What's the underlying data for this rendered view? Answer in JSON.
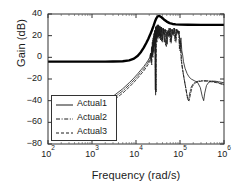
{
  "chart_data": {
    "type": "line",
    "title": "",
    "xlabel": "Frequency (rad/s)",
    "ylabel": "Gain (dB)",
    "xscale": "log",
    "yscale": "linear",
    "xlim": [
      100,
      1000000
    ],
    "ylim": [
      -80,
      40
    ],
    "grid": false,
    "legend_position": "lower-left",
    "xticks": [
      {
        "value": 100,
        "label": "10",
        "exp": "2"
      },
      {
        "value": 1000,
        "label": "10",
        "exp": "3"
      },
      {
        "value": 10000,
        "label": "10",
        "exp": "4"
      },
      {
        "value": 100000,
        "label": "10",
        "exp": "5"
      },
      {
        "value": 1000000,
        "label": "10",
        "exp": "6"
      }
    ],
    "yticks": [
      40,
      20,
      0,
      -20,
      -40,
      -60,
      -80
    ],
    "series": [
      {
        "name": "Nominal",
        "style": "solid-thick",
        "color": "#000000",
        "width": 2.4,
        "in_legend": false,
        "points": [
          [
            100,
            -4
          ],
          [
            300,
            -4
          ],
          [
            1000,
            -4
          ],
          [
            2000,
            -4
          ],
          [
            3000,
            -3.9
          ],
          [
            5000,
            -3.6
          ],
          [
            7000,
            -2.8
          ],
          [
            9000,
            -1.2
          ],
          [
            11000,
            1.5
          ],
          [
            13000,
            5
          ],
          [
            15000,
            9
          ],
          [
            17000,
            13
          ],
          [
            19000,
            17
          ],
          [
            21000,
            21
          ],
          [
            23000,
            25
          ],
          [
            25000,
            29
          ],
          [
            27000,
            33
          ],
          [
            29000,
            36
          ],
          [
            31000,
            37.8
          ],
          [
            34000,
            38.2
          ],
          [
            38000,
            37
          ],
          [
            43000,
            35
          ],
          [
            50000,
            33
          ],
          [
            58000,
            31.6
          ],
          [
            68000,
            30.8
          ],
          [
            80000,
            30.4
          ],
          [
            100000,
            30.2
          ],
          [
            150000,
            30.1
          ],
          [
            300000,
            30
          ],
          [
            600000,
            30
          ],
          [
            1000000,
            30
          ]
        ]
      },
      {
        "name": "Actual1",
        "style": "solid",
        "color": "#1a1a1a",
        "width": 0.8,
        "in_legend": true,
        "points": [
          [
            2000,
            -40
          ],
          [
            3000,
            -36
          ],
          [
            5000,
            -29
          ],
          [
            7000,
            -23.5
          ],
          [
            9000,
            -19
          ],
          [
            11000,
            -15
          ],
          [
            13000,
            -11.5
          ],
          [
            15000,
            -8.5
          ],
          [
            17000,
            -5.5
          ],
          [
            19000,
            -2.5
          ],
          [
            20500,
            0
          ],
          [
            21500,
            4
          ],
          [
            22000,
            -2
          ],
          [
            22500,
            9
          ],
          [
            23000,
            2
          ],
          [
            23500,
            14
          ],
          [
            24000,
            6
          ],
          [
            24500,
            18
          ],
          [
            25000,
            9
          ],
          [
            25500,
            22
          ],
          [
            26000,
            12
          ],
          [
            26500,
            25
          ],
          [
            27000,
            14
          ],
          [
            27500,
            -30
          ],
          [
            27800,
            28
          ],
          [
            28200,
            17
          ],
          [
            28800,
            29
          ],
          [
            29500,
            19
          ],
          [
            30500,
            30
          ],
          [
            31500,
            21
          ],
          [
            32500,
            30
          ],
          [
            33500,
            20
          ],
          [
            35000,
            29
          ],
          [
            36500,
            18
          ],
          [
            38000,
            28
          ],
          [
            40000,
            16
          ],
          [
            42000,
            27
          ],
          [
            44000,
            14
          ],
          [
            46000,
            26
          ],
          [
            48000,
            24
          ],
          [
            51000,
            12
          ],
          [
            54000,
            25
          ],
          [
            57000,
            20
          ],
          [
            60000,
            27
          ],
          [
            63000,
            16
          ],
          [
            67000,
            26
          ],
          [
            71000,
            22
          ],
          [
            75000,
            27
          ],
          [
            80000,
            18
          ],
          [
            85000,
            26
          ],
          [
            90000,
            22
          ],
          [
            95000,
            24
          ],
          [
            100000,
            12
          ],
          [
            105000,
            18
          ],
          [
            110000,
            6
          ],
          [
            115000,
            2
          ],
          [
            120000,
            -4
          ],
          [
            130000,
            -10
          ],
          [
            145000,
            -15
          ],
          [
            160000,
            -18
          ],
          [
            180000,
            -20
          ],
          [
            210000,
            -21.5
          ],
          [
            250000,
            -23
          ],
          [
            290000,
            -28
          ],
          [
            320000,
            -36
          ],
          [
            345000,
            -40
          ],
          [
            365000,
            -33
          ],
          [
            400000,
            -26
          ],
          [
            450000,
            -23
          ],
          [
            520000,
            -22
          ],
          [
            620000,
            -22
          ],
          [
            750000,
            -22.5
          ],
          [
            1000000,
            -23.5
          ]
        ]
      },
      {
        "name": "Actual2",
        "style": "dashdot",
        "color": "#1a1a1a",
        "width": 0.8,
        "in_legend": true,
        "points": [
          [
            2200,
            -43
          ],
          [
            3000,
            -38
          ],
          [
            5000,
            -31
          ],
          [
            7000,
            -25.5
          ],
          [
            9000,
            -21
          ],
          [
            11000,
            -17
          ],
          [
            13000,
            -13.5
          ],
          [
            15000,
            -10.5
          ],
          [
            17000,
            -7.5
          ],
          [
            19000,
            -4.5
          ],
          [
            20500,
            -2
          ],
          [
            21500,
            3
          ],
          [
            22200,
            -5
          ],
          [
            23000,
            10
          ],
          [
            23600,
            1
          ],
          [
            24200,
            16
          ],
          [
            24800,
            5
          ],
          [
            25400,
            20
          ],
          [
            26000,
            10
          ],
          [
            26600,
            24
          ],
          [
            27200,
            13
          ],
          [
            27900,
            -35
          ],
          [
            28300,
            27
          ],
          [
            28900,
            15
          ],
          [
            29600,
            29
          ],
          [
            30400,
            18
          ],
          [
            31400,
            30
          ],
          [
            32400,
            19
          ],
          [
            33600,
            29
          ],
          [
            35000,
            17
          ],
          [
            36500,
            28
          ],
          [
            38200,
            15
          ],
          [
            40000,
            27
          ],
          [
            42000,
            22
          ],
          [
            44500,
            26
          ],
          [
            47000,
            11
          ],
          [
            50000,
            25
          ],
          [
            53000,
            20
          ],
          [
            56500,
            27
          ],
          [
            60000,
            14
          ],
          [
            64000,
            26
          ],
          [
            68000,
            21
          ],
          [
            72500,
            27
          ],
          [
            77000,
            15
          ],
          [
            82000,
            26
          ],
          [
            87000,
            23
          ],
          [
            92000,
            25
          ],
          [
            97000,
            8
          ],
          [
            101000,
            15
          ],
          [
            106000,
            -2
          ],
          [
            111000,
            -8
          ],
          [
            117000,
            -14
          ],
          [
            124000,
            -20
          ],
          [
            132000,
            -26
          ],
          [
            140000,
            -32
          ],
          [
            148000,
            -38
          ],
          [
            156000,
            -40
          ],
          [
            165000,
            -34
          ],
          [
            178000,
            -28
          ],
          [
            195000,
            -25
          ],
          [
            220000,
            -23
          ],
          [
            260000,
            -22
          ],
          [
            320000,
            -21.5
          ],
          [
            400000,
            -21.5
          ],
          [
            520000,
            -22
          ],
          [
            700000,
            -23
          ],
          [
            1000000,
            -25
          ]
        ]
      },
      {
        "name": "Actual3",
        "style": "dashed",
        "color": "#1a1a1a",
        "width": 0.8,
        "in_legend": true,
        "points": [
          [
            2400,
            -45
          ],
          [
            3000,
            -40
          ],
          [
            5000,
            -33
          ],
          [
            7000,
            -27.5
          ],
          [
            9000,
            -23
          ],
          [
            11000,
            -19
          ],
          [
            13000,
            -15.5
          ],
          [
            15000,
            -12.5
          ],
          [
            17000,
            -9.5
          ],
          [
            19000,
            -6.5
          ],
          [
            21000,
            -3
          ],
          [
            22000,
            2
          ],
          [
            22800,
            -7
          ],
          [
            23600,
            8
          ],
          [
            24300,
            0
          ],
          [
            25000,
            14
          ],
          [
            25700,
            4
          ],
          [
            26400,
            19
          ],
          [
            27000,
            9
          ],
          [
            27600,
            23
          ],
          [
            28200,
            12
          ],
          [
            28800,
            -32
          ],
          [
            29200,
            26
          ],
          [
            29900,
            14
          ],
          [
            30700,
            28
          ],
          [
            31600,
            17
          ],
          [
            32600,
            29
          ],
          [
            33700,
            18
          ],
          [
            35000,
            28
          ],
          [
            36400,
            16
          ],
          [
            38000,
            27
          ],
          [
            39800,
            14
          ],
          [
            41800,
            26
          ],
          [
            44000,
            21
          ],
          [
            46500,
            25
          ],
          [
            49000,
            10
          ],
          [
            52000,
            24
          ],
          [
            55500,
            19
          ],
          [
            59000,
            26
          ],
          [
            63000,
            13
          ],
          [
            67000,
            25
          ],
          [
            71500,
            20
          ],
          [
            76000,
            26
          ],
          [
            81000,
            14
          ],
          [
            86000,
            25
          ],
          [
            91000,
            22
          ],
          [
            96000,
            24
          ],
          [
            100000,
            6
          ],
          [
            104000,
            13
          ],
          [
            109000,
            -4
          ],
          [
            114000,
            -10
          ],
          [
            120000,
            -16
          ],
          [
            127000,
            -22
          ],
          [
            135000,
            -28
          ],
          [
            143000,
            -34
          ],
          [
            152000,
            -39
          ],
          [
            162000,
            -40
          ],
          [
            175000,
            -33
          ],
          [
            190000,
            -27
          ],
          [
            215000,
            -24
          ],
          [
            255000,
            -22.5
          ],
          [
            310000,
            -22
          ],
          [
            390000,
            -22
          ],
          [
            500000,
            -22.5
          ],
          [
            700000,
            -23.5
          ],
          [
            1000000,
            -25.5
          ]
        ]
      }
    ]
  },
  "legend": {
    "items": [
      {
        "label": "Actual1",
        "style": "solid"
      },
      {
        "label": "Actual2",
        "style": "dashdot"
      },
      {
        "label": "Actual3",
        "style": "dashed"
      }
    ]
  },
  "axes": {
    "ylabel": "Gain (dB)",
    "xlabel": "Frequency (rad/s)"
  }
}
